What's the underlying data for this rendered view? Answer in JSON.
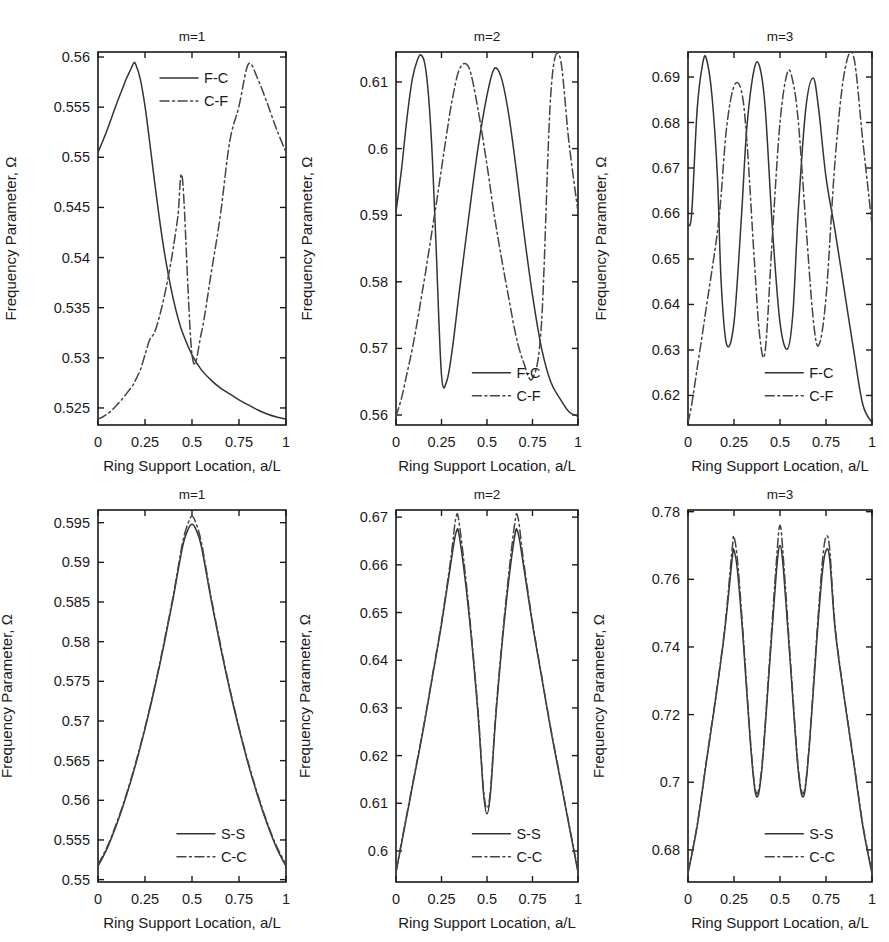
{
  "figure": {
    "panel_count": 6,
    "rows": 2,
    "cols": 3
  },
  "common": {
    "ylabel": "Frequency Parameter, Ω",
    "xlabel": "Ring Support Location, a/L",
    "xlabel_alt": "Ring  Support Location, a/L",
    "xticks": [
      "0",
      "0.25",
      "0.5",
      "0.75",
      "1"
    ],
    "xtickvals": [
      0,
      0.25,
      0.5,
      0.75,
      1
    ],
    "xlim": [
      0,
      1
    ],
    "grid": false,
    "legend_position": "inside"
  },
  "chart_data": [
    {
      "id": "panel-top-left",
      "type": "line",
      "title": "m=1",
      "xlabel": "Ring Support Location, a/L",
      "ylabel": "Frequency Parameter, Ω",
      "xlim": [
        0,
        1
      ],
      "ylim": [
        0.5233,
        0.5605
      ],
      "xticks": [
        0,
        0.25,
        0.5,
        0.75,
        1
      ],
      "xticklabels": [
        "0",
        "0.25",
        "0.5",
        "0.75",
        "1"
      ],
      "yticks": [
        0.525,
        0.53,
        0.535,
        0.54,
        0.545,
        0.55,
        0.555,
        0.56
      ],
      "yticklabels": [
        "0.525",
        "0.53",
        "0.535",
        "0.54",
        "0.545",
        "0.55",
        "0.555",
        "0.56"
      ],
      "legend": [
        "F-C",
        "C-F"
      ],
      "legend_x": 0.33,
      "legend_y": 0.93,
      "x": [
        0,
        0.025,
        0.05,
        0.075,
        0.1,
        0.125,
        0.15,
        0.175,
        0.19,
        0.2,
        0.225,
        0.25,
        0.275,
        0.3,
        0.325,
        0.35,
        0.375,
        0.4,
        0.425,
        0.45,
        0.5,
        0.55,
        0.6,
        0.65,
        0.7,
        0.75,
        0.8,
        0.85,
        0.9,
        0.95,
        1
      ],
      "series": [
        {
          "name": "F-C",
          "style": "solid",
          "values": [
            0.5505,
            0.5516,
            0.5528,
            0.5541,
            0.5554,
            0.5566,
            0.5578,
            0.5588,
            0.5594,
            0.5593,
            0.5578,
            0.5551,
            0.5515,
            0.5477,
            0.5441,
            0.5409,
            0.5382,
            0.5359,
            0.534,
            0.5325,
            0.5303,
            0.5288,
            0.5278,
            0.527,
            0.5264,
            0.5258,
            0.5253,
            0.5248,
            0.5244,
            0.5241,
            0.5239
          ]
        },
        {
          "name": "C-F",
          "style": "dashdot",
          "values": [
            0.5239,
            0.5241,
            0.5244,
            0.5248,
            0.5253,
            0.5258,
            0.5264,
            0.527,
            0.5274,
            0.5278,
            0.5288,
            0.5303,
            0.5318,
            0.5325,
            0.534,
            0.5359,
            0.5382,
            0.5409,
            0.5441,
            0.5477,
            0.5303,
            0.5325,
            0.5382,
            0.5441,
            0.5515,
            0.5551,
            0.5593,
            0.5578,
            0.5554,
            0.5528,
            0.5505
          ]
        }
      ]
    },
    {
      "id": "panel-top-mid",
      "type": "line",
      "title": "m=2",
      "xlabel": "Ring Support Location, a/L",
      "ylabel": "Frequency Parameter, Ω",
      "xlim": [
        0,
        1
      ],
      "ylim": [
        0.5585,
        0.6145
      ],
      "xticks": [
        0,
        0.25,
        0.5,
        0.75,
        1
      ],
      "xticklabels": [
        "0",
        "0.25",
        "0.5",
        "0.75",
        "1"
      ],
      "yticks": [
        0.56,
        0.57,
        0.58,
        0.59,
        0.6,
        0.61
      ],
      "yticklabels": [
        "0.56",
        "0.57",
        "0.58",
        "0.59",
        "0.6",
        "0.61"
      ],
      "legend": [
        "F-C",
        "C-F"
      ],
      "legend_x": 0.42,
      "legend_y": 0.14,
      "x": [
        0,
        0.03,
        0.06,
        0.09,
        0.12,
        0.14,
        0.16,
        0.18,
        0.2,
        0.22,
        0.25,
        0.28,
        0.31,
        0.35,
        0.4,
        0.45,
        0.5,
        0.54,
        0.58,
        0.62,
        0.66,
        0.7,
        0.75,
        0.8,
        0.85,
        0.9,
        0.95,
        1
      ],
      "series": [
        {
          "name": "F-C",
          "style": "solid",
          "values": [
            0.5905,
            0.5968,
            0.6045,
            0.6105,
            0.6135,
            0.614,
            0.6125,
            0.6075,
            0.5985,
            0.5855,
            0.566,
            0.5652,
            0.57,
            0.579,
            0.5898,
            0.6,
            0.608,
            0.612,
            0.6105,
            0.605,
            0.597,
            0.588,
            0.578,
            0.57,
            0.565,
            0.5625,
            0.5605,
            0.5598
          ]
        },
        {
          "name": "C-F",
          "style": "dashdot",
          "values": [
            0.5598,
            0.5625,
            0.5662,
            0.57,
            0.5745,
            0.5778,
            0.581,
            0.5845,
            0.588,
            0.5915,
            0.597,
            0.6025,
            0.6075,
            0.612,
            0.6122,
            0.606,
            0.5975,
            0.59,
            0.5835,
            0.5775,
            0.5718,
            0.568,
            0.5655,
            0.574,
            0.608,
            0.6138,
            0.601,
            0.5905
          ]
        }
      ]
    },
    {
      "id": "panel-top-right",
      "type": "line",
      "title": "m=3",
      "xlabel": "Ring Support Location, a/L",
      "ylabel": "Frequency Parameter, Ω",
      "xlim": [
        0,
        1
      ],
      "ylim": [
        0.6135,
        0.6955
      ],
      "xticks": [
        0,
        0.25,
        0.5,
        0.75,
        1
      ],
      "xticklabels": [
        "0",
        "0.25",
        "0.5",
        "0.75",
        "1"
      ],
      "yticks": [
        0.62,
        0.63,
        0.64,
        0.65,
        0.66,
        0.67,
        0.68,
        0.69
      ],
      "yticklabels": [
        "0.62",
        "0.63",
        "0.64",
        "0.65",
        "0.66",
        "0.67",
        "0.68",
        "0.69"
      ],
      "legend": [
        "F-C",
        "C-F"
      ],
      "legend_x": 0.42,
      "legend_y": 0.14,
      "x": [
        0,
        0.02,
        0.05,
        0.08,
        0.1,
        0.13,
        0.16,
        0.18,
        0.21,
        0.25,
        0.29,
        0.32,
        0.36,
        0.39,
        0.42,
        0.46,
        0.5,
        0.54,
        0.57,
        0.6,
        0.64,
        0.68,
        0.71,
        0.75,
        0.8,
        0.85,
        0.9,
        0.95,
        1
      ],
      "series": [
        {
          "name": "F-C",
          "style": "solid",
          "values": [
            0.6575,
            0.66,
            0.683,
            0.693,
            0.694,
            0.686,
            0.668,
            0.645,
            0.6312,
            0.636,
            0.659,
            0.679,
            0.6918,
            0.6922,
            0.683,
            0.656,
            0.636,
            0.6302,
            0.638,
            0.661,
            0.683,
            0.6898,
            0.683,
            0.668,
            0.656,
            0.643,
            0.63,
            0.618,
            0.614
          ]
        },
        {
          "name": "C-F",
          "style": "dashdot",
          "values": [
            0.614,
            0.618,
            0.626,
            0.634,
            0.6395,
            0.6475,
            0.656,
            0.664,
            0.679,
            0.688,
            0.687,
            0.676,
            0.65,
            0.633,
            0.63,
            0.656,
            0.68,
            0.691,
            0.689,
            0.68,
            0.658,
            0.637,
            0.631,
            0.6415,
            0.672,
            0.691,
            0.6945,
            0.676,
            0.6575
          ]
        }
      ]
    },
    {
      "id": "panel-bottom-left",
      "type": "line",
      "title": "m=1",
      "xlabel": "Ring  Support Location, a/L",
      "ylabel": "Frequency Parameter, Ω",
      "xlim": [
        0,
        1
      ],
      "ylim": [
        0.5497,
        0.5966
      ],
      "xticks": [
        0,
        0.25,
        0.5,
        0.75,
        1
      ],
      "xticklabels": [
        "0",
        "0.25",
        "0.5",
        "0.75",
        "1"
      ],
      "yticks": [
        0.55,
        0.555,
        0.56,
        0.565,
        0.57,
        0.575,
        0.58,
        0.585,
        0.59,
        0.595
      ],
      "yticklabels": [
        "0.55",
        "0.555",
        "0.56",
        "0.565",
        "0.57",
        "0.575",
        "0.58",
        "0.585",
        "0.59",
        "0.595"
      ],
      "legend": [
        "S-S",
        "C-C"
      ],
      "legend_x": 0.42,
      "legend_y": 0.13,
      "x": [
        0,
        0.05,
        0.1,
        0.15,
        0.2,
        0.25,
        0.3,
        0.35,
        0.4,
        0.45,
        0.48,
        0.5,
        0.52,
        0.55,
        0.6,
        0.65,
        0.7,
        0.75,
        0.8,
        0.85,
        0.9,
        0.95,
        1
      ],
      "series": [
        {
          "name": "S-S",
          "style": "solid",
          "values": [
            0.5517,
            0.554,
            0.557,
            0.5605,
            0.5645,
            0.569,
            0.574,
            0.5795,
            0.5855,
            0.592,
            0.5942,
            0.5948,
            0.5942,
            0.592,
            0.5855,
            0.5795,
            0.574,
            0.569,
            0.5645,
            0.5605,
            0.557,
            0.554,
            0.5517
          ]
        },
        {
          "name": "C-C",
          "style": "dashdot",
          "values": [
            0.5519,
            0.5542,
            0.5572,
            0.5607,
            0.5647,
            0.5692,
            0.5742,
            0.5798,
            0.5858,
            0.5925,
            0.595,
            0.5958,
            0.595,
            0.5925,
            0.5858,
            0.5798,
            0.5742,
            0.5692,
            0.5647,
            0.5607,
            0.5572,
            0.5542,
            0.5519
          ]
        }
      ]
    },
    {
      "id": "panel-bottom-mid",
      "type": "line",
      "title": "m=2",
      "xlabel": "Ring Support Location, a/L",
      "ylabel": "Frequency Parameter, Ω",
      "xlim": [
        0,
        1
      ],
      "ylim": [
        0.5935,
        0.6715
      ],
      "xticks": [
        0,
        0.25,
        0.5,
        0.75,
        1
      ],
      "xticklabels": [
        "0",
        "0.25",
        "0.5",
        "0.75",
        "1"
      ],
      "yticks": [
        0.6,
        0.61,
        0.62,
        0.63,
        0.64,
        0.65,
        0.66,
        0.67
      ],
      "yticklabels": [
        "0.6",
        "0.61",
        "0.62",
        "0.63",
        "0.64",
        "0.65",
        "0.66",
        "0.67"
      ],
      "legend": [
        "S-S",
        "C-C"
      ],
      "legend_x": 0.42,
      "legend_y": 0.13,
      "x": [
        0,
        0.05,
        0.1,
        0.15,
        0.2,
        0.25,
        0.3,
        0.33,
        0.35,
        0.4,
        0.45,
        0.48,
        0.5,
        0.52,
        0.55,
        0.6,
        0.65,
        0.67,
        0.7,
        0.75,
        0.8,
        0.85,
        0.9,
        0.95,
        1
      ],
      "series": [
        {
          "name": "S-S",
          "style": "solid",
          "values": [
            0.5955,
            0.6055,
            0.6155,
            0.6255,
            0.6365,
            0.6475,
            0.66,
            0.6668,
            0.6655,
            0.65,
            0.629,
            0.6125,
            0.6078,
            0.6125,
            0.629,
            0.65,
            0.6655,
            0.6668,
            0.66,
            0.6475,
            0.6365,
            0.6255,
            0.6155,
            0.6055,
            0.5955
          ]
        },
        {
          "name": "C-C",
          "style": "dashdot",
          "values": [
            0.5958,
            0.6058,
            0.6158,
            0.6258,
            0.6368,
            0.648,
            0.661,
            0.67,
            0.668,
            0.651,
            0.6298,
            0.6132,
            0.609,
            0.6132,
            0.6298,
            0.651,
            0.668,
            0.67,
            0.661,
            0.648,
            0.6368,
            0.6258,
            0.6158,
            0.6058,
            0.5958
          ]
        }
      ]
    },
    {
      "id": "panel-bottom-right",
      "type": "line",
      "title": "m=3",
      "xlabel": "Ring Support Location, a/L",
      "ylabel": "Frequency Parameter, Ω",
      "xlim": [
        0,
        1
      ],
      "ylim": [
        0.6705,
        0.7805
      ],
      "xticks": [
        0,
        0.25,
        0.5,
        0.75,
        1
      ],
      "xticklabels": [
        "0",
        "0.25",
        "0.5",
        "0.75",
        "1"
      ],
      "yticks": [
        0.68,
        0.7,
        0.72,
        0.74,
        0.76,
        0.78
      ],
      "yticklabels": [
        "0.68",
        "0.7",
        "0.72",
        "0.74",
        "0.76",
        "0.78"
      ],
      "legend": [
        "S-S",
        "C-C"
      ],
      "legend_x": 0.42,
      "legend_y": 0.13,
      "x": [
        0,
        0.05,
        0.1,
        0.15,
        0.2,
        0.24,
        0.25,
        0.27,
        0.3,
        0.34,
        0.37,
        0.4,
        0.44,
        0.48,
        0.5,
        0.52,
        0.56,
        0.6,
        0.63,
        0.66,
        0.7,
        0.73,
        0.75,
        0.77,
        0.8,
        0.85,
        0.9,
        0.95,
        1
      ],
      "series": [
        {
          "name": "S-S",
          "style": "solid",
          "values": [
            0.673,
            0.687,
            0.706,
            0.7245,
            0.745,
            0.766,
            0.7685,
            0.762,
            0.742,
            0.711,
            0.696,
            0.703,
            0.732,
            0.762,
            0.77,
            0.762,
            0.732,
            0.703,
            0.696,
            0.711,
            0.742,
            0.762,
            0.7685,
            0.766,
            0.745,
            0.7245,
            0.706,
            0.687,
            0.673
          ]
        },
        {
          "name": "C-C",
          "style": "dashdot",
          "values": [
            0.6735,
            0.6875,
            0.7065,
            0.725,
            0.7458,
            0.769,
            0.7725,
            0.765,
            0.7435,
            0.712,
            0.697,
            0.704,
            0.7335,
            0.765,
            0.776,
            0.765,
            0.7335,
            0.704,
            0.697,
            0.712,
            0.7435,
            0.765,
            0.7725,
            0.769,
            0.7458,
            0.725,
            0.7065,
            0.6875,
            0.6735
          ]
        }
      ]
    }
  ]
}
